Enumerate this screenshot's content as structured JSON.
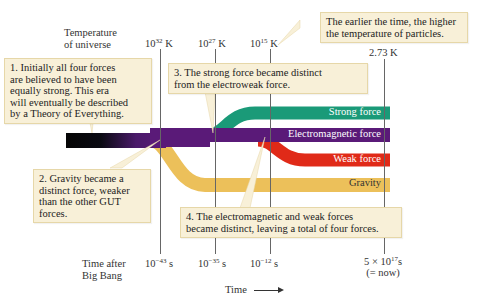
{
  "axes": {
    "temperature_label_line1": "Temperature",
    "temperature_label_line2": "of universe",
    "temperature_ticks": [
      {
        "base": "10",
        "exp": "32",
        "unit": " K"
      },
      {
        "base": "10",
        "exp": "27",
        "unit": " K"
      },
      {
        "base": "10",
        "exp": "15",
        "unit": " K"
      },
      {
        "value": "2.73 K"
      }
    ],
    "time_label_line1": "Time after",
    "time_label_line2": "Big Bang",
    "time_ticks": [
      {
        "base": "10",
        "exp": "−43",
        "unit": " s"
      },
      {
        "base": "10",
        "exp": "−35",
        "unit": " s"
      },
      {
        "base": "10",
        "exp": "−12",
        "unit": " s"
      },
      {
        "prefix": "5 × 10",
        "exp": "17",
        "unit": "s",
        "note": "(= now)"
      }
    ],
    "time_arrow_label": "Time"
  },
  "forces": {
    "strong": {
      "label": "Strong force",
      "color": "#1a9a78"
    },
    "electromagnetic": {
      "label": "Electromagnetic force",
      "color": "#5a1a78"
    },
    "weak": {
      "label": "Weak force",
      "color": "#e02a18"
    },
    "gravity": {
      "label": "Gravity",
      "color": "#ecc05a"
    },
    "unified_color": "#0a0a0a"
  },
  "callouts": {
    "temperature_note": [
      "The earlier the time, the higher",
      "the temperature of particles."
    ],
    "step1": [
      "1. Initially all four forces",
      "are believed to have been",
      "equally strong. This era",
      "will eventually be described",
      "by a Theory of Everything."
    ],
    "step2": [
      "2. Gravity became a",
      "distinct force, weaker",
      "than the other GUT",
      "forces."
    ],
    "step3": [
      "3. The strong force became distinct",
      "from the electroweak force."
    ],
    "step4": [
      "4. The electromagnetic and weak forces",
      "became distinct, leaving a total of four forces."
    ]
  }
}
